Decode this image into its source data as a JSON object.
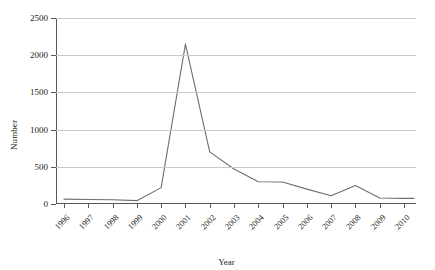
{
  "chart_data": {
    "type": "line",
    "title": "",
    "xlabel": "Year",
    "ylabel": "Number",
    "categories": [
      "1996",
      "1997",
      "1998",
      "1999",
      "2000",
      "2001",
      "2002",
      "2003",
      "2004",
      "2005",
      "2006",
      "2007",
      "2008",
      "2009",
      "2010"
    ],
    "values": [
      65,
      60,
      58,
      45,
      220,
      2150,
      700,
      470,
      300,
      295,
      200,
      110,
      250,
      80,
      75
    ],
    "series": [
      {
        "name": "Number",
        "values": [
          65,
          60,
          58,
          45,
          220,
          2150,
          700,
          470,
          300,
          295,
          200,
          110,
          250,
          80,
          75
        ]
      }
    ],
    "ylim": [
      0,
      2500
    ],
    "yticks": [
      0,
      500,
      1000,
      1500,
      2000,
      2500
    ],
    "ytick_labels": [
      "0",
      "500",
      "1000",
      "1500",
      "2000",
      "2500"
    ],
    "grid": "horizontal",
    "legend": "none",
    "line_color": "#6d6e71",
    "grid_color": "#c9c9c9",
    "axis_color": "#58595b"
  }
}
